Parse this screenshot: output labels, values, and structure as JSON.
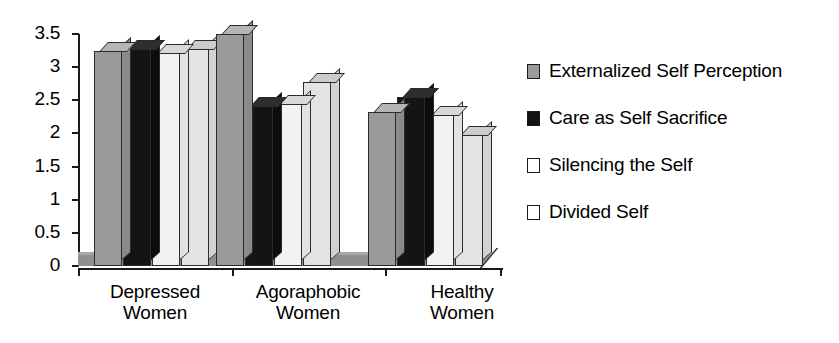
{
  "chart_data": {
    "type": "bar",
    "title": "",
    "xlabel": "",
    "ylabel": "",
    "ylim": [
      0,
      3.5
    ],
    "ytick_labels": [
      "3.5",
      "3",
      "2.5",
      "2",
      "1.5",
      "1",
      "0.5",
      "0"
    ],
    "ytick_values": [
      3.5,
      3,
      2.5,
      2,
      1.5,
      1,
      0.5,
      0
    ],
    "grid": false,
    "legend_position": "right",
    "categories": [
      "Depressed Women",
      "Agoraphobic Women",
      "Healthy Women"
    ],
    "category_lines": [
      [
        "Depressed",
        "Women"
      ],
      [
        "Agoraphobic",
        "Women"
      ],
      [
        "Healthy",
        "Women"
      ]
    ],
    "series": [
      {
        "name": "Externalized Self Perception",
        "swatch": "medium-gray",
        "color": "#9a9a9a",
        "values": [
          3.25,
          3.5,
          2.32
        ]
      },
      {
        "name": "Care as Self Sacrifice",
        "swatch": "black",
        "color": "#121212",
        "values": [
          3.27,
          2.42,
          2.55
        ]
      },
      {
        "name": "Silencing the Self",
        "swatch": "white-outline",
        "color": "#f2f2f2",
        "values": [
          3.22,
          2.45,
          2.28
        ]
      },
      {
        "name": "Divided Self",
        "swatch": "white-outline",
        "color": "#e3e3e3",
        "values": [
          3.28,
          2.78,
          1.98
        ]
      }
    ]
  },
  "axis": {
    "ticks": [
      {
        "label": "3.5"
      },
      {
        "label": "3"
      },
      {
        "label": "2.5"
      },
      {
        "label": "2"
      },
      {
        "label": "1.5"
      },
      {
        "label": "1"
      },
      {
        "label": "0.5"
      },
      {
        "label": "0"
      }
    ]
  },
  "categories": [
    {
      "line1": "Depressed",
      "line2": "Women"
    },
    {
      "line1": "Agoraphobic",
      "line2": "Women"
    },
    {
      "line1": "Healthy",
      "line2": "Women"
    }
  ],
  "legend": {
    "items": [
      {
        "label": "Externalized Self Perception"
      },
      {
        "label": "Care as Self Sacrifice"
      },
      {
        "label": "Silencing the Self"
      },
      {
        "label": "Divided Self"
      }
    ]
  }
}
